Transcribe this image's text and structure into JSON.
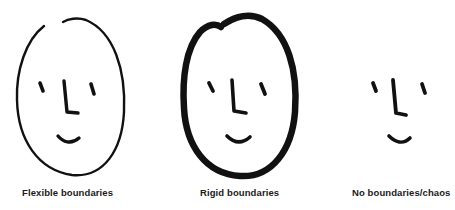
{
  "figure": {
    "panels": [
      {
        "id": "flexible",
        "label": "Flexible boundaries",
        "boundary": "thin outline with small gap at top"
      },
      {
        "id": "rigid",
        "label": "Rigid boundaries",
        "boundary": "thick heavy outline"
      },
      {
        "id": "none",
        "label": "No boundaries/chaos",
        "boundary": "no outline"
      }
    ],
    "colors": {
      "ink": "#111111",
      "background": "#ffffff"
    }
  }
}
